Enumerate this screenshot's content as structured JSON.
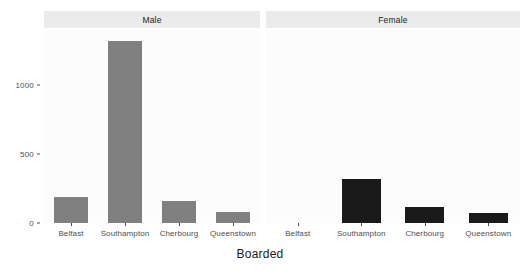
{
  "chart_data": {
    "type": "bar",
    "title": "",
    "subtitle": "",
    "xlabel": "Boarded",
    "ylabel": "",
    "categories": [
      "Belfast",
      "Southampton",
      "Cherbourg",
      "Queenstown"
    ],
    "facet_by": "Sex",
    "facets": [
      {
        "name": "Male",
        "label": "Male",
        "color": "#808080",
        "values": [
          190,
          1320,
          160,
          80
        ]
      },
      {
        "name": "Female",
        "label": "Female",
        "color": "#1a1a1a",
        "values": [
          0,
          320,
          115,
          70
        ]
      }
    ],
    "ylim": [
      0,
      1400
    ],
    "yticks": [
      0,
      500,
      1000
    ],
    "ytick_labels": [
      "0",
      "500",
      "1000"
    ],
    "grid": false,
    "legend": "none",
    "panel_background": "#fcfcfc",
    "strip_background": "#ebebeb",
    "axis_text_color": "#4d4d4d"
  }
}
